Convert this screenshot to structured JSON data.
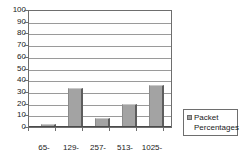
{
  "chart_data": {
    "type": "bar",
    "title": "",
    "subtitle": "",
    "xlabel": "",
    "ylabel": "",
    "categories": [
      "65-128",
      "129-256",
      "257-512",
      "513-1024",
      "1025-1518"
    ],
    "category_lines": [
      [
        "65-",
        "128"
      ],
      [
        "129-",
        "256"
      ],
      [
        "257-",
        "512"
      ],
      [
        "513-",
        "1024"
      ],
      [
        "1025-",
        "1518"
      ]
    ],
    "series": [
      {
        "name": "Packet Percentages",
        "values": [
          1,
          33,
          7,
          19,
          35
        ],
        "color": "#a3a3a3"
      }
    ],
    "ylim": [
      0,
      100
    ],
    "y_ticks": [
      0,
      10,
      20,
      30,
      40,
      50,
      60,
      70,
      80,
      90,
      100
    ],
    "y_tick_labels": [
      "0",
      "10",
      "20",
      "30",
      "40",
      "50",
      "60",
      "70",
      "80",
      "90",
      "100"
    ],
    "grid": true,
    "grid_axis": "y",
    "legend": {
      "position": "right",
      "entries": [
        {
          "label_line_1": "Packet",
          "label_line_2": "Percentages",
          "swatch_color": "#a3a3a3"
        }
      ]
    },
    "colors": {
      "bar_face": "#a3a3a3",
      "bar_shadow": "#5d5d5d",
      "bar_highlight": "#c9c9c9",
      "gridline": "#9a9a9a",
      "frame": "#6e6e6e",
      "text": "#1a1a1a",
      "background": "#ffffff"
    }
  }
}
